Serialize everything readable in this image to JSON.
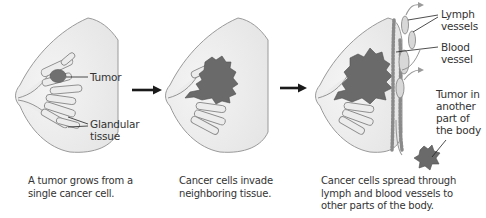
{
  "panels": [
    {
      "id": "stage-1",
      "caption_lines": [
        "A tumor grows from a",
        "single cancer cell."
      ],
      "labels": {
        "tumor": "Tumor",
        "glandular_1": "Glandular",
        "glandular_2": "tissue"
      }
    },
    {
      "id": "stage-2",
      "caption_lines": [
        "Cancer cells invade",
        "neighboring tissue."
      ]
    },
    {
      "id": "stage-3",
      "caption_lines": [
        "Cancer cells spread through",
        "lymph and blood vessels to",
        "other parts of the body."
      ],
      "labels": {
        "lymph_1": "Lymph",
        "lymph_2": "vessels",
        "blood_1": "Blood",
        "blood_2": "vessel",
        "meta_1": "Tumor in",
        "meta_2": "another",
        "meta_3": "part of",
        "meta_4": "the body"
      }
    }
  ],
  "colors": {
    "outline": "#9a9a9a",
    "tissue_fill": "#f2f2f2",
    "gland_fill": "#e4e4e4",
    "tumor": "#6e6e6e",
    "arrow": "#1a1a1a"
  }
}
